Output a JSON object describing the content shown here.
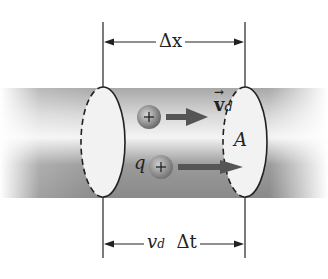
{
  "diagram": {
    "labels": {
      "delta_x": "Δx",
      "drift_velocity_symbol": "v",
      "drift_velocity_sub": "d",
      "area": "A",
      "charge": "q",
      "vd_dt_v": "v",
      "vd_dt_sub": "d",
      "vd_dt_rest": "Δt",
      "plus_sign": "+"
    },
    "colors": {
      "conductor_dark": "#6e6e6e",
      "conductor_light": "#efefef",
      "ellipse_fill": "#f2f2f2",
      "line": "#222222",
      "arrow": "#555555",
      "charge_fill": "#8a8a8a"
    }
  }
}
